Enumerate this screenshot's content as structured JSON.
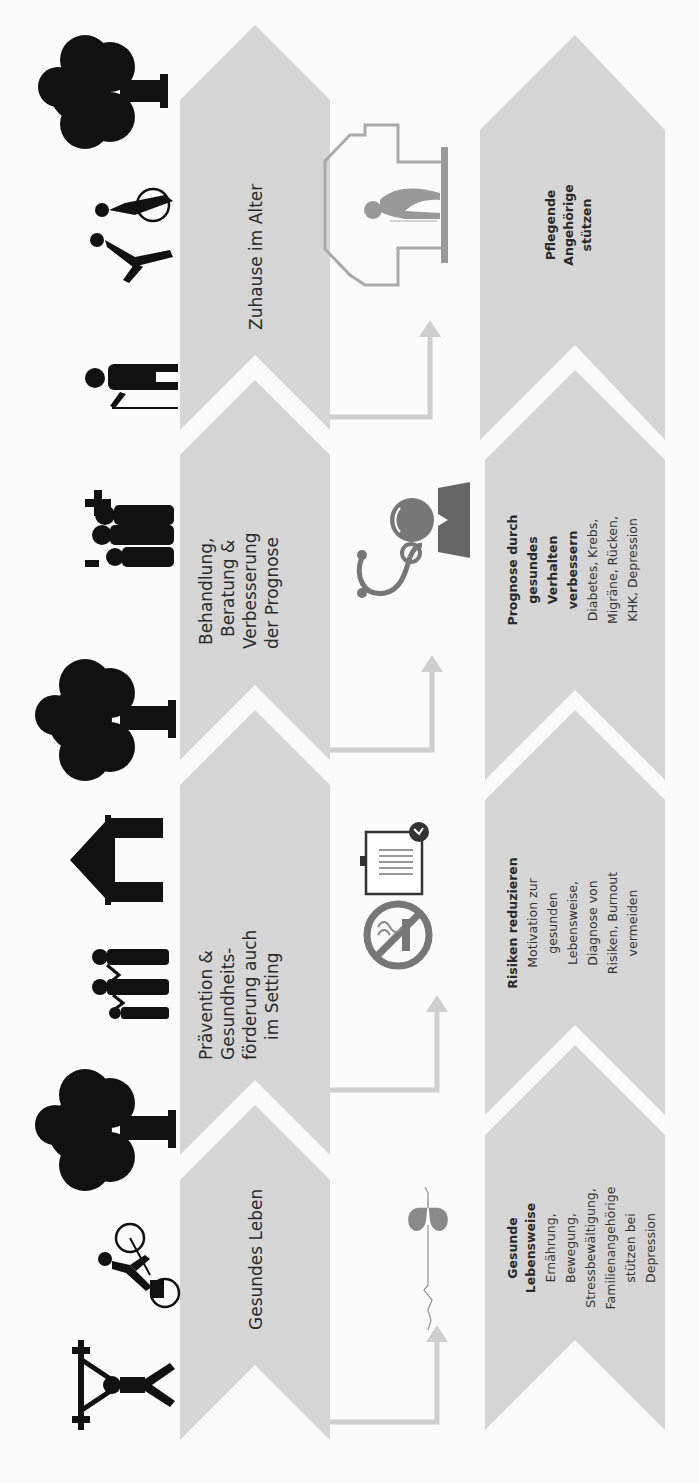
{
  "diagram": {
    "orientation": "rotated-90-ccw",
    "colors": {
      "chevron": "#d6d6d6",
      "text": "#2b2b2b",
      "icon_black": "#111111",
      "icon_grey": "#8a8a8a",
      "arrow": "#cfcfcf",
      "background": "#fbfbfb"
    },
    "stages": [
      {
        "label": "Gesundes Leben"
      },
      {
        "label_lines": [
          "Prävention &",
          "Gesundheits-",
          "förderung auch",
          "im Setting"
        ]
      },
      {
        "label_lines": [
          "Behandlung,",
          "Beratung &",
          "Verbesserung",
          "der Prognose"
        ]
      },
      {
        "label": "Zuhause im Alter"
      }
    ],
    "details": [
      {
        "title_lines": [
          "Gesunde",
          "Lebensweise"
        ],
        "body_lines": [
          "Ernährung,",
          "Bewegung,",
          "Stressbewältigung,",
          "Familienangehörige",
          "stützen bei",
          "Depression"
        ]
      },
      {
        "title_lines": [
          "Risiken  reduzieren"
        ],
        "body_lines": [
          "Motivation zur",
          "gesunden",
          "Lebensweise,",
          "Diagnose von",
          "Risiken, Burnout",
          "vermeiden"
        ]
      },
      {
        "title_lines": [
          "Prognose durch",
          "gesundes",
          "Verhalten",
          "verbessern"
        ],
        "body_lines": [
          "Diabetes, Krebs,",
          "Migräne, Rücken,",
          "KHK, Depression"
        ]
      },
      {
        "title_lines": [
          "Pflegende",
          "Angehörige",
          "stützen"
        ],
        "body_lines": []
      }
    ],
    "top_icons": [
      "weightlifter-icon",
      "cyclist-icon",
      "tree-icon",
      "family-icon",
      "house-icon",
      "tree-icon",
      "family-medical-icon",
      "elderly-person-icon",
      "wheelchair-assist-icon",
      "tree-icon"
    ],
    "middle_icons": [
      "heartbeat-icon",
      "no-smoking-icon",
      "clipboard-check-icon",
      "stethoscope-icon",
      "doctor-icon",
      "home-care-icon"
    ]
  }
}
